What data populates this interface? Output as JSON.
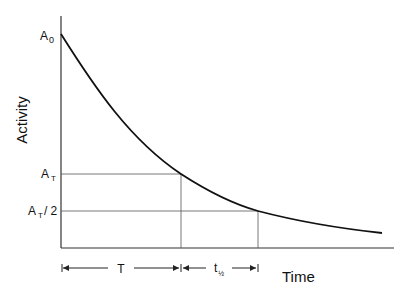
{
  "diagram": {
    "type": "exponential-decay",
    "y_axis_label": "Activity",
    "x_axis_label": "Time",
    "y_labels": {
      "a0": {
        "main": "A",
        "sub": "0"
      },
      "at": {
        "main": "A",
        "sub": "T"
      },
      "at_half": {
        "main": "A",
        "sub": "T",
        "suffix": "/ 2"
      }
    },
    "intervals": {
      "t": "T",
      "half_life": {
        "main": "t",
        "sub": "½"
      }
    },
    "colors": {
      "curve": "#111111",
      "axis": "#333333",
      "guide": "#555555"
    }
  }
}
